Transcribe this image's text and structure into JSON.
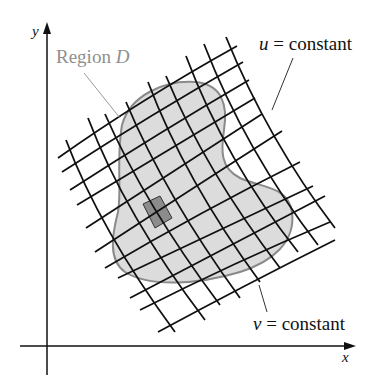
{
  "diagram": {
    "axes": {
      "x_label": "x",
      "y_label": "y"
    },
    "labels": {
      "region": "Region ",
      "region_var": "D",
      "u_var": "u",
      "u_rest": " = constant",
      "v_var": "v",
      "v_rest": " = constant"
    },
    "colors": {
      "region_fill": "#dcdcdc",
      "region_stroke": "#8a8a8a",
      "cell_fill": "#8c8c8c",
      "grid_stroke": "#111111",
      "label_gray": "#8f8f8f",
      "text": "#111111"
    }
  }
}
